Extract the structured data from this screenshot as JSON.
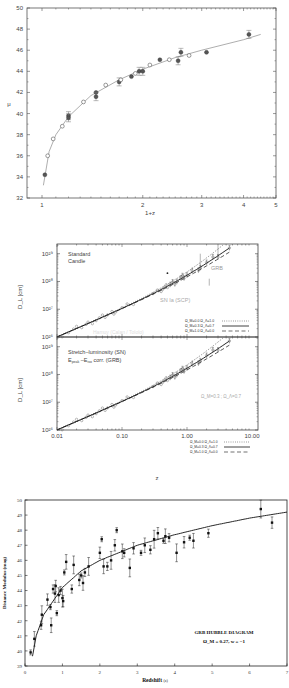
{
  "chart_data": [
    {
      "type": "scatter",
      "title": "",
      "xlabel": "1+z",
      "ylabel": "μ",
      "xscale": "log",
      "xlim": [
        0.95,
        5
      ],
      "ylim": [
        32,
        50
      ],
      "xticks": [
        "1",
        "2",
        "3",
        "4",
        "5"
      ],
      "yticks": [
        "32",
        "34",
        "36",
        "38",
        "40",
        "42",
        "44",
        "46",
        "48",
        "50"
      ],
      "grid": false,
      "series": [
        {
          "name": "filled (GRB)",
          "marker": "filled-circle",
          "x": [
            1.02,
            1.2,
            1.2,
            1.45,
            1.45,
            1.7,
            1.85,
            1.95,
            2.0,
            2.25,
            2.55,
            2.6,
            3.1,
            4.15
          ],
          "y": [
            34.2,
            39.8,
            39.6,
            42.0,
            41.6,
            43.0,
            43.5,
            44.0,
            44.0,
            45.1,
            45.0,
            45.8,
            45.8,
            47.5
          ]
        },
        {
          "name": "open (SN)",
          "marker": "open-circle",
          "x": [
            1.04,
            1.08,
            1.15,
            1.33,
            1.55,
            1.72,
            1.9,
            2.1,
            2.4,
            2.75
          ],
          "y": [
            36.0,
            37.6,
            38.8,
            41.1,
            42.7,
            43.2,
            43.8,
            44.6,
            45.1,
            45.5
          ]
        },
        {
          "name": "model curve",
          "type": "line",
          "x": [
            1.01,
            1.05,
            1.1,
            1.2,
            1.4,
            1.7,
            2.0,
            2.5,
            3.0,
            4.0,
            4.5
          ],
          "y": [
            33.2,
            36.4,
            38.0,
            39.7,
            41.7,
            43.2,
            44.2,
            45.3,
            46.0,
            47.0,
            47.5
          ]
        }
      ]
    },
    {
      "type": "scatter",
      "panel": "top",
      "title": "",
      "annotations": [
        "Standard",
        "Candle",
        "GRB",
        "SN Ia (SCP)",
        "Hamuy (Calan / Tololo)"
      ],
      "xlabel": "z",
      "ylabel": "D_L [cm]",
      "xscale": "log",
      "yscale": "log",
      "xlim": [
        0.01,
        10
      ],
      "ylim": [
        1e+26,
        1e+29
      ],
      "yticks": [
        "10^26",
        "10^27",
        "10^28",
        "10^29"
      ],
      "legend": [
        {
          "label": "Ω_M=0.0  Ω_Λ=1.0",
          "style": "dotted"
        },
        {
          "label": "Ω_M=0.3  Ω_Λ=0.7",
          "style": "solid"
        },
        {
          "label": "Ω_M=1.0  Ω_Λ=0.0",
          "style": "dashed"
        }
      ],
      "legend_position": "lower right"
    },
    {
      "type": "scatter",
      "panel": "bottom",
      "title": "",
      "annotations": [
        "Stretch–luminosity (SN)",
        "E_peak –E_iso corr. (GRB)",
        "Ω_M=0.3 ; Ω_Λ=0.7"
      ],
      "xlabel": "z",
      "ylabel": "D_L [cm]",
      "xscale": "log",
      "yscale": "log",
      "xlim": [
        0.01,
        10
      ],
      "ylim": [
        1e+26,
        1e+29
      ],
      "xticks": [
        "0.01",
        "0.10",
        "1.00",
        "10.00"
      ],
      "yticks": [
        "10^26",
        "10^27",
        "10^28",
        "10^29"
      ],
      "legend": [
        {
          "label": "Ω_M=0.0  Ω_Λ=1.0",
          "style": "dotted"
        },
        {
          "label": "Ω_M=0.3  Ω_Λ=0.7",
          "style": "solid"
        },
        {
          "label": "Ω_M=1.0  Ω_Λ=0.0",
          "style": "dashed"
        }
      ],
      "legend_position": "lower right"
    },
    {
      "type": "scatter",
      "title": "GRB HUBBLE DIAGRAM",
      "subtitle": "Ω_M = 0.27, w = −1",
      "xlabel": "Redshift (z)",
      "ylabel": "Distance Modulus (mag)",
      "xlim": [
        0,
        7
      ],
      "ylim": [
        39,
        50
      ],
      "xticks": [
        "0",
        "1",
        "2",
        "3",
        "4",
        "5",
        "6",
        "7"
      ],
      "yticks": [
        "39",
        "40",
        "41",
        "42",
        "43",
        "44",
        "45",
        "46",
        "47",
        "48",
        "49",
        "50"
      ],
      "grid": false,
      "series": [
        {
          "name": "GRB",
          "marker": "filled-square",
          "x": [
            0.15,
            0.25,
            0.43,
            0.45,
            0.6,
            0.68,
            0.7,
            0.75,
            0.8,
            0.82,
            0.85,
            0.9,
            0.95,
            1.0,
            1.02,
            1.05,
            1.1,
            1.25,
            1.3,
            1.45,
            1.5,
            1.55,
            1.6,
            1.7,
            2.0,
            2.05,
            2.1,
            2.2,
            2.3,
            2.4,
            2.45,
            2.6,
            2.65,
            2.8,
            2.9,
            3.1,
            3.2,
            3.35,
            3.45,
            3.55,
            3.7,
            3.75,
            3.85,
            4.05,
            4.25,
            4.4,
            4.5,
            4.9,
            6.3,
            6.6
          ],
          "y": [
            39.9,
            40.8,
            41.7,
            42.4,
            43.4,
            42.9,
            41.7,
            44.1,
            43.8,
            44.3,
            42.5,
            43.7,
            44.0,
            43.5,
            43.3,
            45.2,
            45.9,
            44.1,
            45.7,
            44.7,
            45.0,
            44.5,
            45.2,
            45.6,
            46.5,
            47.4,
            45.6,
            45.6,
            46.0,
            47.0,
            48.0,
            46.6,
            46.5,
            45.5,
            46.8,
            46.5,
            47.0,
            46.7,
            47.4,
            47.8,
            47.3,
            47.6,
            47.5,
            46.5,
            47.2,
            47.5,
            47.3,
            47.8,
            49.4,
            48.5
          ]
        },
        {
          "name": "ΛCDM model",
          "type": "line",
          "x": [
            0.1,
            0.3,
            0.5,
            1.0,
            1.5,
            2.0,
            3.0,
            4.0,
            5.0,
            6.0,
            7.0
          ],
          "y": [
            38.3,
            41.0,
            42.4,
            44.2,
            45.3,
            46.0,
            47.0,
            47.7,
            48.3,
            48.8,
            49.2
          ]
        }
      ]
    }
  ],
  "panel1": {
    "xlabel": "1+z",
    "ylabel": "μ",
    "xticks": [
      {
        "v": "1",
        "x": 42
      },
      {
        "v": "2",
        "x": 143
      },
      {
        "v": "3",
        "x": 202
      },
      {
        "v": "4",
        "x": 244
      },
      {
        "v": "5",
        "x": 276
      }
    ],
    "yticks": [
      "32",
      "34",
      "36",
      "38",
      "40",
      "42",
      "44",
      "46",
      "48",
      "50"
    ]
  },
  "panel2": {
    "top_label1": "Standard",
    "top_label2": "Candle",
    "grb_label": "GRB",
    "sn_label": "SN Ia (SCP)",
    "hamuy_label": "Hamuy (Calan / Tololo)",
    "bottom_label1": "Stretch–luminosity (SN)",
    "bottom_label2": "E",
    "bottom_label2_sub1": "peak",
    "bottom_label2_mid": " –E",
    "bottom_label2_sub2": "iso",
    "bottom_label2_end": " corr. (GRB)",
    "model_label": "Ω_M=0.3 ; Ω_Λ=0.7",
    "ylabel": "D_L [cm]",
    "xlabel": "z",
    "yticks": [
      "10²⁶",
      "10²⁷",
      "10²⁸",
      "10²⁹"
    ],
    "xticks": [
      "0.01",
      "0.10",
      "1.00",
      "10.00"
    ],
    "legend": [
      "Ω_M=0.0  Ω_Λ=1.0",
      "Ω_M=0.3  Ω_Λ=0.7",
      "Ω_M=1.0  Ω_Λ=0.0"
    ]
  },
  "panel3": {
    "title": "GRB HUBBLE DIAGRAM",
    "subtitle": "Ω_M = 0.27, w = −1",
    "xlabel": "Redshift",
    "xlabel_unit": "(z)",
    "ylabel": "Distance Modulus (mag)",
    "xticks": [
      "0",
      "1",
      "2",
      "3",
      "4",
      "5",
      "6",
      "7"
    ],
    "yticks": [
      "39",
      "40",
      "41",
      "42",
      "43",
      "44",
      "45",
      "46",
      "47",
      "48",
      "49",
      "50"
    ]
  }
}
